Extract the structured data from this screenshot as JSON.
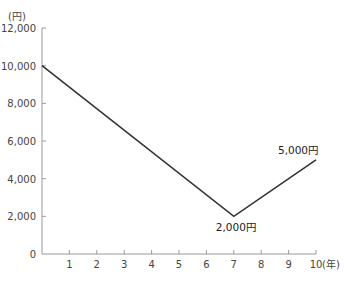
{
  "chart_data": {
    "type": "line",
    "title": "",
    "xlabel": "(年)",
    "ylabel": "(円)",
    "x": [
      0,
      7,
      10
    ],
    "series": [
      {
        "name": "value",
        "values": [
          10000,
          2000,
          5000
        ],
        "color": "#333333"
      }
    ],
    "annotations": [
      {
        "x": 7,
        "y": 2000,
        "text": "2,000円"
      },
      {
        "x": 10,
        "y": 5000,
        "text": "5,000円"
      }
    ],
    "xticks": [
      "1",
      "2",
      "3",
      "4",
      "5",
      "6",
      "7",
      "8",
      "9",
      "10"
    ],
    "yticks": [
      "0",
      "2,000",
      "4,000",
      "6,000",
      "8,000",
      "10,000",
      "12,000"
    ],
    "xlim": [
      0,
      10
    ],
    "ylim": [
      0,
      12000
    ],
    "grid": false,
    "legend": "none"
  },
  "colors": {
    "line": "#333333",
    "axis": "#999999",
    "text": "#444444"
  }
}
